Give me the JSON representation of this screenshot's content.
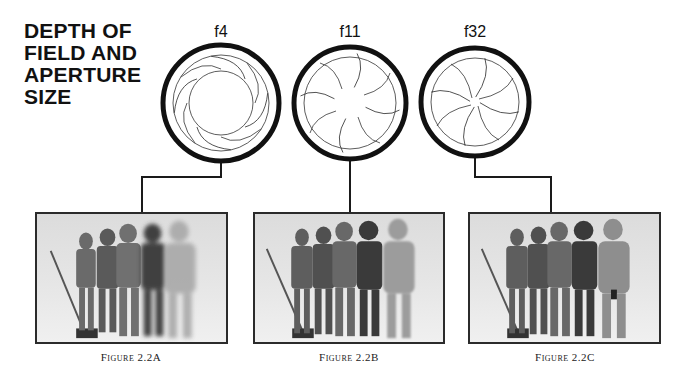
{
  "title": {
    "lines": [
      "DEPTH OF",
      "FIELD AND",
      "APERTURE",
      "SIZE"
    ]
  },
  "apertures": [
    {
      "label": "f4",
      "opening": "large"
    },
    {
      "label": "f11",
      "opening": "medium"
    },
    {
      "label": "f32",
      "opening": "small"
    }
  ],
  "figures": [
    {
      "caption": "Figure 2.2A",
      "focus": "shallow depth of field, foreground figure blurred"
    },
    {
      "caption": "Figure 2.2B",
      "focus": "moderate depth of field"
    },
    {
      "caption": "Figure 2.2C",
      "focus": "deep depth of field, all figures sharp"
    }
  ],
  "colors": {
    "ink": "#111111",
    "frame": "#2b2b2b",
    "photo_bg": "#e3e3e3"
  }
}
